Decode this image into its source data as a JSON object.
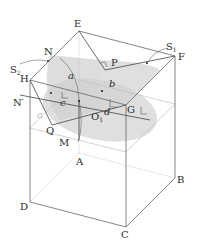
{
  "figure": {
    "type": "geometry-diagram",
    "colors": {
      "edge": "#555555",
      "edge_light": "#bbbbbb",
      "shade": "#d6d6d6",
      "shade_dark": "#c4c4c4",
      "label": "#2a2a2a"
    }
  },
  "vertices": {
    "A": "A",
    "B": "B",
    "C": "C",
    "D": "D",
    "E": "E",
    "F": "F",
    "G": "G",
    "H": "H"
  },
  "points": {
    "N": "N",
    "N_prime": "N′",
    "P": "P",
    "Q": "Q",
    "M": "M",
    "O1": "O",
    "O1_sub": "1"
  },
  "surfaces": {
    "S1": "S",
    "S1_sub": "1",
    "S2": "S",
    "S2_sub": "2"
  },
  "segments": {
    "a": "a",
    "a_faint": "a",
    "b": "b",
    "c": "c",
    "d": "d"
  }
}
